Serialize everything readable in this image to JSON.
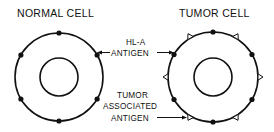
{
  "diagram": {
    "titles": {
      "normal_cell": "NORMAL CELL",
      "tumor_cell": "TUMOR CELL"
    },
    "labels": {
      "hla_antigen": [
        "HL-A",
        "ANTIGEN"
      ],
      "tumor_associated_antigen": [
        "TUMOR",
        "ASSOCIATED",
        "ANTIGEN"
      ]
    },
    "cells": [
      {
        "name": "normal-cell",
        "hla_antigen_count": 6,
        "tumor_antigen_count": 0
      },
      {
        "name": "tumor-cell",
        "hla_antigen_count": 6,
        "tumor_antigen_count": 6
      }
    ],
    "legend": {
      "hla_antigen_marker": "filled-dot",
      "tumor_antigen_marker": "open-triangle"
    },
    "colors": {
      "stroke": "#111111",
      "background": "#ffffff"
    }
  }
}
